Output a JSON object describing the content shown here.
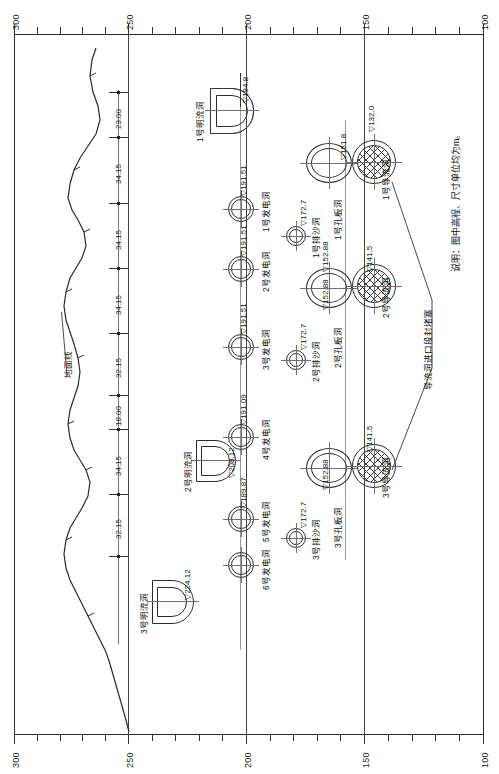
{
  "drawing": {
    "type": "engineering-longitudinal-profile",
    "orientation": "rotated-90-ccw",
    "note": "说明：图中高程、尺寸单位均为m。",
    "ground_line_label": "地面线"
  },
  "axis": {
    "label_top": "elevation-scale-top",
    "label_bottom": "elevation-scale-bottom",
    "ticks": [
      "300",
      "250",
      "200",
      "150",
      "100"
    ],
    "minor_tick_count": 5,
    "range": [
      300,
      100
    ],
    "unit": "m"
  },
  "dimension_chain": {
    "name": "spacing-between-tunnel-axes",
    "values": [
      "23.00",
      "34.15",
      "34.15",
      "34.15",
      "32.15",
      "18.00",
      "34.15",
      "32.15"
    ],
    "unit": "m"
  },
  "open_flow_tunnels": [
    {
      "label": "1号明流洞",
      "elevation": "▽194.8"
    },
    {
      "label": "2号明流洞",
      "elevation": "▽208.12"
    },
    {
      "label": "3号明流洞",
      "elevation": "▽224.12"
    }
  ],
  "power_tunnels": [
    {
      "label": "1号发电洞",
      "elevation": "▽191.51"
    },
    {
      "label": "2号发电洞",
      "elevation": "▽191.51"
    },
    {
      "label": "3号发电洞",
      "elevation": "▽191.51"
    },
    {
      "label": "4号发电洞",
      "elevation": "▽191.09"
    },
    {
      "label": "5号发电洞",
      "elevation": "▽189.87"
    },
    {
      "label": "6号发电洞",
      "elevation": ""
    }
  ],
  "sand_flush_tunnels": [
    {
      "label": "1号排沙洞",
      "elevation": "▽172.7"
    },
    {
      "label": "2号排沙洞",
      "elevation": "▽172.7"
    },
    {
      "label": "3号排沙洞",
      "elevation": "▽172.7"
    }
  ],
  "orifice_plate_tunnels": [
    {
      "label": "1号孔板洞",
      "elevation_top": "▽152.88",
      "elevation_low": "▽151.8"
    },
    {
      "label": "2号孔板洞",
      "elevation_top": "▽152.88",
      "elevation_low": "▽141.5"
    },
    {
      "label": "3号孔板洞",
      "elevation_top": "▽152.88",
      "elevation_low": "▽141.5"
    }
  ],
  "diversion_tunnels": [
    {
      "label": "1号导流洞",
      "elevation": "▽132.0"
    },
    {
      "label": "2号导流洞",
      "elevation": "▽141.5"
    },
    {
      "label": "3号导流洞",
      "elevation": "▽141.5"
    }
  ],
  "callout": {
    "label": "导流洞进口段封堵塞"
  }
}
